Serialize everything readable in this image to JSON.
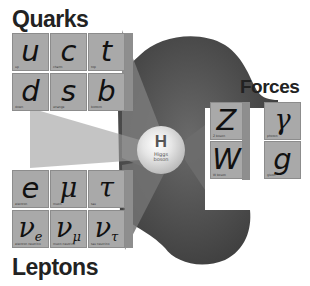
{
  "diagram": {
    "title_quarks": "Quarks",
    "title_forces": "Forces",
    "title_leptons": "Leptons",
    "higgs": {
      "symbol": "H",
      "label_line1": "Higgs",
      "label_line2": "boson"
    },
    "quarks": [
      {
        "symbol": "u",
        "label": "up"
      },
      {
        "symbol": "c",
        "label": "charm"
      },
      {
        "symbol": "t",
        "label": "top"
      },
      {
        "symbol": "d",
        "label": "down"
      },
      {
        "symbol": "s",
        "label": "strange"
      },
      {
        "symbol": "b",
        "label": "bottom"
      }
    ],
    "leptons": [
      {
        "symbol": "e",
        "label": "electron"
      },
      {
        "symbol": "μ",
        "label": "muon"
      },
      {
        "symbol": "τ",
        "label": "tau"
      },
      {
        "symbol": "ν",
        "sub": "e",
        "label": "electron neutrino"
      },
      {
        "symbol": "ν",
        "sub": "μ",
        "label": "muon neutrino"
      },
      {
        "symbol": "ν",
        "sub": "τ",
        "label": "tau neutrino"
      }
    ],
    "forces": [
      {
        "symbol": "Z",
        "label": "Z boson"
      },
      {
        "symbol": "γ",
        "label": "photon"
      },
      {
        "symbol": "W",
        "label": "W boson"
      },
      {
        "symbol": "g",
        "label": "gluon"
      }
    ],
    "colors": {
      "tile": "#a9a9a9",
      "tile_side": "#8e8e8e",
      "blob": "#555555",
      "text": "#222222"
    }
  }
}
